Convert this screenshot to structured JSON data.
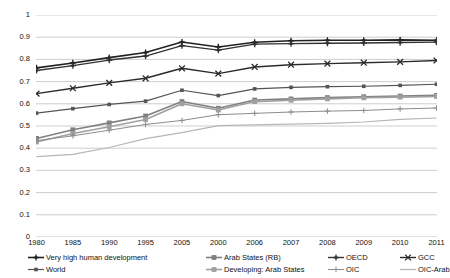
{
  "chart_data": {
    "type": "line",
    "title": "",
    "subtitle": "",
    "xlabel": "",
    "ylabel": "",
    "ylim": [
      0,
      1
    ],
    "ytick_step": 0.1,
    "grid": "horizontal",
    "legend_position": "bottom",
    "legend_columns": 4,
    "categories": [
      "1980",
      "1985",
      "1990",
      "1995",
      "2005",
      "2000",
      "2006",
      "2007",
      "2008",
      "2009",
      "2010",
      "2011"
    ],
    "ytick_labels": [
      "1",
      "0.9",
      "0.8",
      "0.7",
      "0.6",
      "0.5",
      "0.4",
      "0.3",
      "0.2",
      "0.1",
      "0"
    ],
    "ytick_values": [
      1,
      0.9,
      0.8,
      0.7,
      0.6,
      0.5,
      0.4,
      0.3,
      0.2,
      0.1,
      0
    ],
    "series": [
      {
        "name": "Very high human development",
        "marker": "cross",
        "color": "#222222",
        "width": 1.6,
        "values": [
          0.762,
          0.784,
          0.808,
          0.831,
          0.878,
          0.856,
          0.877,
          0.884,
          0.886,
          0.886,
          0.888,
          0.886
        ]
      },
      {
        "name": "Arab States (RB)",
        "marker": "square",
        "color": "#808080",
        "width": 1.6,
        "values": [
          0.444,
          0.483,
          0.514,
          0.545,
          0.61,
          0.58,
          0.617,
          0.622,
          0.628,
          0.632,
          0.635,
          0.638
        ]
      },
      {
        "name": "OECD",
        "marker": "cross",
        "color": "#333333",
        "width": 1.4,
        "values": [
          0.75,
          0.772,
          0.797,
          0.815,
          0.862,
          0.842,
          0.869,
          0.871,
          0.873,
          0.874,
          0.876,
          0.878
        ]
      },
      {
        "name": "GCC",
        "marker": "x",
        "color": "#2b2b2b",
        "width": 1.4,
        "values": [
          0.646,
          0.67,
          0.694,
          0.715,
          0.76,
          0.736,
          0.766,
          0.776,
          0.781,
          0.785,
          0.789,
          0.795
        ]
      },
      {
        "name": "World",
        "marker": "square-small",
        "color": "#555555",
        "width": 1.2,
        "values": [
          0.558,
          0.578,
          0.597,
          0.612,
          0.661,
          0.637,
          0.667,
          0.674,
          0.677,
          0.679,
          0.683,
          0.688
        ]
      },
      {
        "name": "Developing: Arab States",
        "marker": "square",
        "color": "#a0a0a0",
        "width": 1.6,
        "values": [
          0.428,
          0.466,
          0.497,
          0.529,
          0.6,
          0.572,
          0.61,
          0.616,
          0.622,
          0.627,
          0.63,
          0.633
        ]
      },
      {
        "name": "OIC",
        "marker": "plus",
        "color": "#8c8c8c",
        "width": 1.0,
        "values": [
          0.434,
          0.456,
          0.481,
          0.507,
          0.525,
          0.551,
          0.557,
          0.563,
          0.567,
          0.57,
          0.577,
          0.581
        ]
      },
      {
        "name": "OIC-Arab",
        "marker": "none",
        "color": "#b5b5b5",
        "width": 1.2,
        "values": [
          0.362,
          0.372,
          0.403,
          0.443,
          0.47,
          0.502,
          0.505,
          0.508,
          0.512,
          0.518,
          0.53,
          0.536
        ]
      }
    ]
  },
  "legend": {
    "row1": [
      "Very high human development",
      "Arab States (RB)",
      "OECD",
      "GCC"
    ],
    "row2": [
      "World",
      "Developing: Arab States",
      "OIC",
      "OIC-Arab"
    ]
  },
  "colors": {
    "grid": "#b9b9b9",
    "text": "#111111",
    "background": "#ffffff"
  }
}
